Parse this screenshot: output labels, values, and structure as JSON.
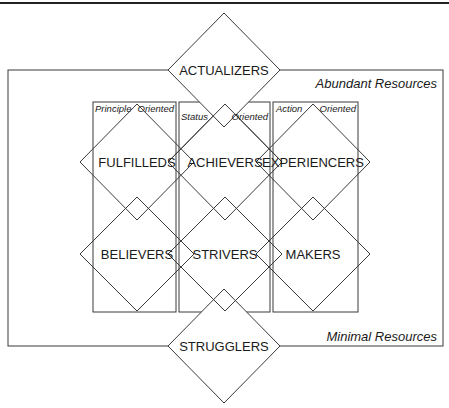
{
  "diagram": {
    "resources": {
      "top": "Abundant Resources",
      "bottom": "Minimal Resources"
    },
    "orientations": [
      {
        "left": "Principle",
        "right": "Oriented"
      },
      {
        "left": "Status",
        "right": "Oriented"
      },
      {
        "left": "Action",
        "right": "Oriented"
      }
    ],
    "segments": {
      "actualizers": "ACTUALIZERS",
      "fulfilleds": "FULFILLEDS",
      "achievers": "ACHIEVERS",
      "experiencers": "EXPERIENCERS",
      "believers": "BELIEVERS",
      "strivers": "STRIVERS",
      "makers": "MAKERS",
      "strugglers": "STRUGGLERS"
    },
    "colors": {
      "line": "#3a3a3a",
      "text": "#1a1a1a",
      "background": "#ffffff"
    }
  }
}
